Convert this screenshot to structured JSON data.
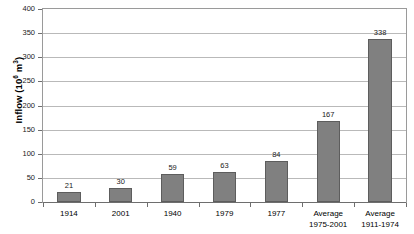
{
  "chart_data": {
    "type": "bar",
    "title": "",
    "subtitle": "",
    "xlabel": "",
    "ylabel": "Inflow (10^6 m^3)",
    "ylabel_prefix": "Inflow (10",
    "ylabel_exponent": "6",
    "ylabel_mid": " m",
    "ylabel_exponent2": "3",
    "ylabel_suffix": ")",
    "categories": [
      "1914",
      "2001",
      "1940",
      "1979",
      "1977",
      "Average\n1975-2001",
      "Average\n1911-1974"
    ],
    "values": [
      21,
      30,
      59,
      63,
      84,
      167,
      338
    ],
    "data_labels": [
      "21",
      "30",
      "59",
      "63",
      "84",
      "167",
      "338"
    ],
    "ylim": [
      0,
      400
    ],
    "ytick_values": [
      0,
      50,
      100,
      150,
      200,
      250,
      300,
      350,
      400
    ],
    "ytick_labels": [
      "0",
      "50",
      "100",
      "150",
      "200",
      "250",
      "300",
      "350",
      "400"
    ],
    "grid": true,
    "legend": false,
    "legend_position": "none",
    "bar_color": "#808080",
    "bar_border_color": "#5d5d5d",
    "gridline_color": "#b9b9b9",
    "axis_color": "#6e6e6e",
    "plot_border_color": "#9a9a9a",
    "background_color": "#ffffff"
  }
}
